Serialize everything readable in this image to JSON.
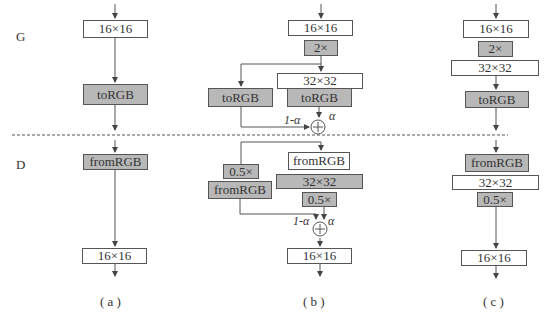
{
  "labels": {
    "generator": "G",
    "discriminator": "D"
  },
  "captions": {
    "a": "( a )",
    "b": "( b )",
    "c": "( c )"
  },
  "col_a": {
    "g_res": "16×16",
    "g_torgb": "toRGB",
    "d_fromrgb": "fromRGB",
    "d_res": "16×16"
  },
  "col_b": {
    "g_res_in": "16×16",
    "g_upsample": "2×",
    "g_res_out": "32×32",
    "g_torgb_left": "toRGB",
    "g_torgb_right": "toRGB",
    "g_weight_left": "1-α",
    "g_weight_right": "α",
    "d_downsample_left": "0.5×",
    "d_fromrgb_left": "fromRGB",
    "d_fromrgb_right": "fromRGB",
    "d_res_in": "32×32",
    "d_downsample_right": "0.5×",
    "d_weight_left": "1-α",
    "d_weight_right": "α",
    "d_res_out": "16×16"
  },
  "col_c": {
    "g_res_in": "16×16",
    "g_upsample": "2×",
    "g_res_out": "32×32",
    "g_torgb": "toRGB",
    "d_fromrgb": "fromRGB",
    "d_res_in": "32×32",
    "d_downsample": "0.5×",
    "d_res_out": "16×16"
  },
  "colors": {
    "gray_block": "#b8b8b8",
    "stroke": "#555555"
  }
}
